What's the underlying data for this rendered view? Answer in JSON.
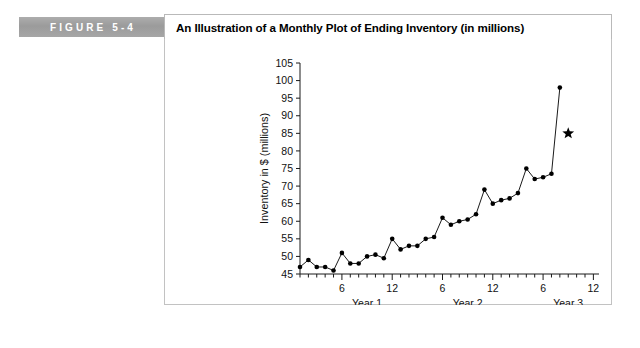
{
  "figure": {
    "tag_label": "FIGURE 5-4",
    "title": "An Illustration of a Monthly Plot of Ending Inventory (in millions)"
  },
  "colors": {
    "tag_background": "#a4a4a4",
    "tag_text": "#ffffff",
    "panel_border": "#c2c2c2",
    "series_line": "#1a1a1a",
    "marker": "#000000"
  },
  "chart_data": {
    "type": "line",
    "title": "An Illustration of a Monthly Plot of Ending Inventory (in millions)",
    "xlabel": "Month",
    "ylabel": "Inventory in $ (millions)",
    "ylim": [
      45,
      105
    ],
    "ytick_values": [
      45,
      50,
      55,
      60,
      65,
      70,
      75,
      80,
      85,
      90,
      95,
      100,
      105
    ],
    "ytick_labels": [
      "45",
      "50",
      "55",
      "60",
      "65",
      "70",
      "75",
      "80",
      "85",
      "90",
      "95",
      "100",
      "105"
    ],
    "xlim": [
      1,
      35
    ],
    "xtick_major_values": [
      6,
      12,
      18,
      24,
      30,
      36
    ],
    "xtick_major_labels": [
      "6",
      "12",
      "6",
      "12",
      "6",
      "12"
    ],
    "xtick_minor_step": 1,
    "year_labels": [
      {
        "label": "Year 1",
        "center_month": 9
      },
      {
        "label": "Year 2",
        "center_month": 21
      },
      {
        "label": "Year 3",
        "center_month": 33
      }
    ],
    "grid": false,
    "legend": false,
    "x": [
      1,
      2,
      3,
      4,
      5,
      6,
      7,
      8,
      9,
      10,
      11,
      12,
      13,
      14,
      15,
      16,
      17,
      18,
      19,
      20,
      21,
      22,
      23,
      24,
      25,
      26,
      27,
      28,
      29,
      30,
      31
    ],
    "values": [
      47,
      49,
      47,
      47,
      46,
      51,
      48,
      48,
      50,
      50.5,
      49.5,
      55,
      52,
      53,
      53,
      55,
      55.5,
      61,
      59,
      60,
      60.5,
      62,
      69,
      65,
      66,
      66.5,
      68,
      75,
      72,
      72.5,
      73.5
    ],
    "series": [
      {
        "name": "Ending Inventory",
        "values": [
          47,
          49,
          47,
          47,
          46,
          51,
          48,
          48,
          50,
          50.5,
          49.5,
          55,
          52,
          53,
          53,
          55,
          55.5,
          61,
          59,
          60,
          60.5,
          62,
          69,
          65,
          66,
          66.5,
          68,
          75,
          72,
          72.5,
          73.5
        ]
      }
    ],
    "final_point": {
      "x": 32,
      "y": 98,
      "label": "final-spike-point"
    },
    "annotation_marker": {
      "x": 33,
      "y": 85,
      "shape": "star",
      "label": "star-marker"
    }
  }
}
